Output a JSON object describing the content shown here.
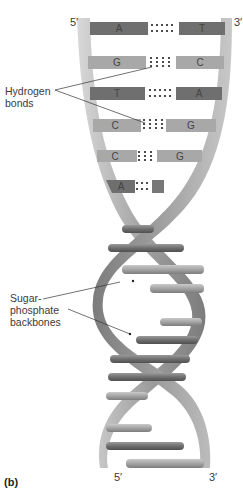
{
  "labels": {
    "hydrogen_bonds": [
      "Hydrogen",
      "bonds"
    ],
    "sugar_phosphate": [
      "Sugar-",
      "phosphate",
      "backbones"
    ],
    "panel": "(b)"
  },
  "strand_ends": {
    "top_left": "5′",
    "top_right": "3′",
    "bottom_left": "5′",
    "bottom_right": "3′"
  },
  "base_pairs": [
    {
      "left": "A",
      "right": "T",
      "bonds": 2
    },
    {
      "left": "G",
      "right": "C",
      "bonds": 3
    },
    {
      "left": "T",
      "right": "A",
      "bonds": 2
    },
    {
      "left": "C",
      "right": "G",
      "bonds": 3
    },
    {
      "left": "C",
      "right": "G",
      "bonds": 3
    },
    {
      "left": "A",
      "right": "",
      "bonds": 2
    }
  ],
  "colors": {
    "backbone": "#8a8a8a",
    "backbone_light": "#bdbdbd",
    "base_dark": "#6e6e6e",
    "base_light": "#a9a9a9",
    "text": "#3a3a3a"
  }
}
